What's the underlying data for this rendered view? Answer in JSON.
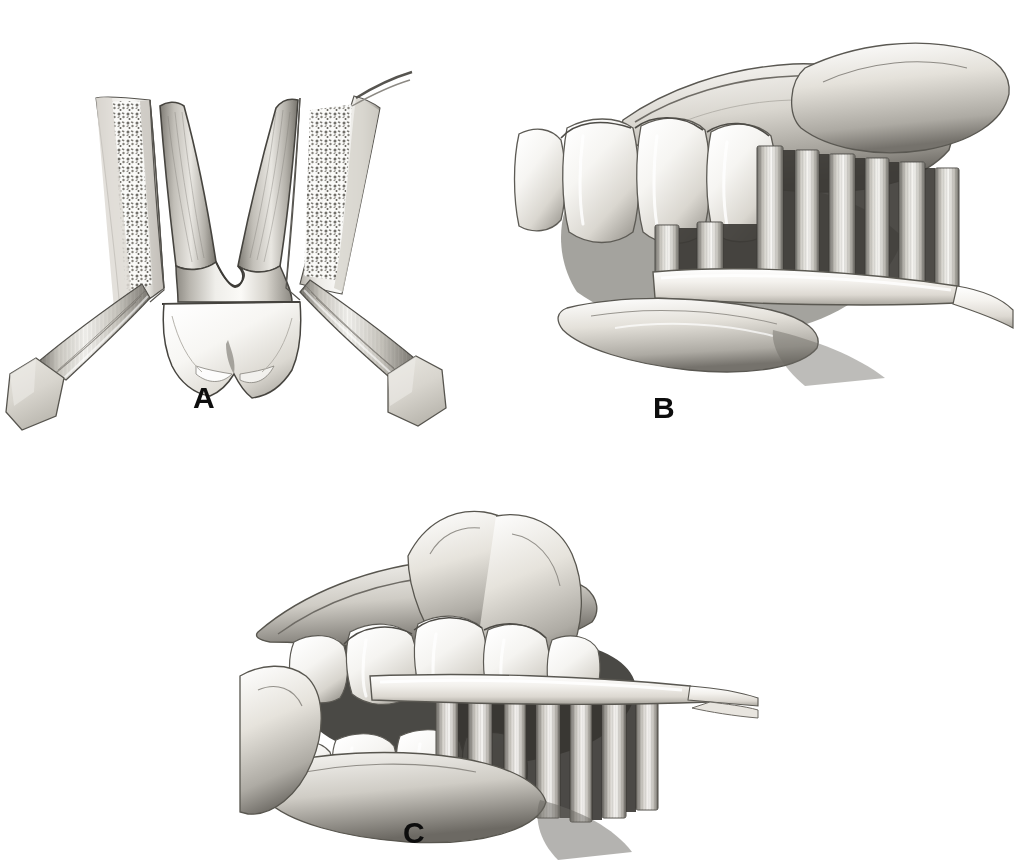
{
  "figure": {
    "background_color": "#ffffff",
    "ink_color": "#0d0d0d",
    "style": "grayscale halftone medical illustration",
    "width": 1014,
    "height": 865
  },
  "panels": [
    {
      "id": "A",
      "label": "A",
      "label_x": 193,
      "label_y": 383,
      "caption": "Cross-section of molar in alveolar bone with bristles angled into the gingival sulcus",
      "elements": [
        "tooth-cross-section",
        "mesial-root",
        "distal-root",
        "crown",
        "cemento-enamel-junction",
        "alveolar-bone-left",
        "alveolar-bone-right",
        "trabecular-bone-pattern",
        "periodontal-ligament",
        "gingiva",
        "bristle-bundle-left",
        "bristle-bundle-right",
        "brush-head-left",
        "brush-head-right"
      ]
    },
    {
      "id": "B",
      "label": "B",
      "label_x": 653,
      "label_y": 393,
      "caption": "Lateral view of maxillary teeth with lip retracted and brush bristles at the gingival margin",
      "elements": [
        "maxillary-teeth",
        "gingiva",
        "retracted-lip",
        "index-finger",
        "thumb",
        "toothbrush-head",
        "toothbrush-handle",
        "bristle-tufts"
      ]
    },
    {
      "id": "C",
      "label": "C",
      "label_x": 403,
      "label_y": 818,
      "caption": "Open mouth view showing mandibular teeth brushed with bristles directed apically",
      "elements": [
        "maxillary-teeth",
        "mandibular-teeth",
        "oral-cavity-shadow",
        "upper-lip",
        "lower-lip",
        "fingers",
        "toothbrush-head",
        "toothbrush-handle",
        "bristle-tufts"
      ]
    }
  ],
  "palette": {
    "paper": "#ffffff",
    "label_ink": "#0d0d0d",
    "enamel_light": "#fbfaf8",
    "enamel_mid": "#e2e0dc",
    "dentin_mid": "#cdcac4",
    "shadow_mid": "#9a978f",
    "shadow_deep": "#5f5d58",
    "cavity_dark": "#2f2e2b",
    "bone_light": "#f2f1ee",
    "bristle_light": "#f4f3f0",
    "bristle_dark": "#6d6a64",
    "brush_body": "#dedbd4",
    "outline": "#4a4843"
  }
}
